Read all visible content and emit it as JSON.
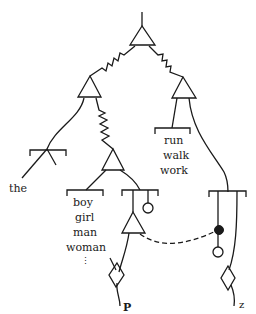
{
  "diagram": {
    "type": "network-grammar-tree",
    "colors": {
      "stroke": "#1a1a1a",
      "background": "#ffffff"
    },
    "labels": {
      "determiner": "the",
      "verbs": [
        "run",
        "walk",
        "work"
      ],
      "nouns": [
        "boy",
        "girl",
        "man",
        "woman"
      ],
      "noun_ellipsis": "⋮",
      "terminal_left": "P",
      "terminal_right": "z"
    },
    "nodes": [
      {
        "id": "root-and-node",
        "shape": "triangle"
      },
      {
        "id": "np-and-node",
        "shape": "triangle"
      },
      {
        "id": "vp-and-node",
        "shape": "triangle"
      },
      {
        "id": "noun-and-node",
        "shape": "triangle"
      },
      {
        "id": "lower-and-node",
        "shape": "triangle"
      },
      {
        "id": "left-diamond",
        "shape": "diamond"
      },
      {
        "id": "right-diamond",
        "shape": "diamond"
      },
      {
        "id": "filled-node",
        "shape": "filled-circle"
      },
      {
        "id": "open-node-upper",
        "shape": "open-circle"
      },
      {
        "id": "open-node-lower",
        "shape": "open-circle"
      }
    ],
    "connectors": [
      "zigzag",
      "dashed"
    ]
  }
}
